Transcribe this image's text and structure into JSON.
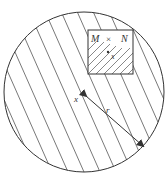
{
  "diagram": {
    "type": "geometric-illustration",
    "labels": {
      "square_label_M": "M",
      "square_label_times": "×",
      "square_label_N": "N",
      "inner_point": "x",
      "center_point": "x",
      "radius": "r"
    },
    "colors": {
      "stroke": "#333333",
      "background": "#ffffff"
    }
  }
}
